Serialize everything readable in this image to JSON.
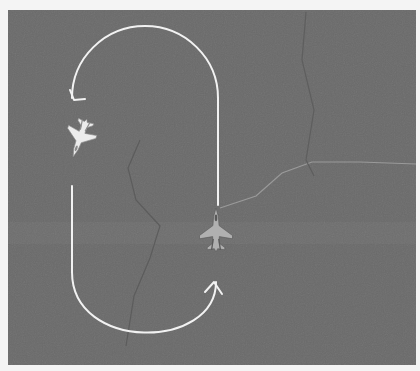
{
  "scene": {
    "kind": "racetrack-intercept-diagram",
    "background_color": "#6a6a6a",
    "band_color": "#727272",
    "page_color": "#f4f4f4",
    "frame": {
      "x": 8,
      "y": 10,
      "w": 408,
      "h": 355
    }
  },
  "flight_path": {
    "color": "#f2f2f2",
    "width": 2,
    "top_arc": {
      "from": [
        72,
        98
      ],
      "apex": [
        144,
        26
      ],
      "to": [
        218,
        98
      ],
      "direction": "counter-clockwise"
    },
    "right_leg": {
      "x": 218,
      "y_top": 98,
      "y_bottom": 205
    },
    "left_leg": {
      "x": 72,
      "y_top": 186,
      "y_bottom": 272
    },
    "bottom_arc": {
      "from": [
        72,
        272
      ],
      "apex": [
        144,
        346
      ],
      "to": [
        216,
        282
      ]
    },
    "arrows": [
      {
        "name": "arrow-top-left",
        "tip": [
          74,
          100
        ],
        "direction": "down-left"
      },
      {
        "name": "arrow-bottom-right",
        "tip": [
          214,
          282
        ],
        "direction": "up"
      }
    ]
  },
  "terrain_lines": [
    {
      "name": "border-east",
      "color": "#9a9a9a",
      "points": [
        [
          220,
          208
        ],
        [
          256,
          196
        ],
        [
          282,
          173
        ],
        [
          312,
          162
        ],
        [
          360,
          162
        ],
        [
          416,
          164
        ]
      ]
    },
    {
      "name": "ridge-center",
      "color": "#5c5c5c",
      "points": [
        [
          140,
          140
        ],
        [
          128,
          168
        ],
        [
          136,
          200
        ],
        [
          160,
          226
        ],
        [
          150,
          258
        ],
        [
          134,
          296
        ],
        [
          126,
          346
        ]
      ]
    },
    {
      "name": "ridge-north",
      "color": "#5e5e5e",
      "points": [
        [
          306,
          12
        ],
        [
          302,
          60
        ],
        [
          314,
          110
        ],
        [
          306,
          160
        ],
        [
          314,
          176
        ]
      ]
    }
  ],
  "aircraft": [
    {
      "name": "bandit-jet",
      "role": "opposing",
      "color": "#ececec",
      "x": 80,
      "y": 138,
      "heading_deg": 200,
      "scale": 1.0
    },
    {
      "name": "friendly-jet",
      "role": "own-ship",
      "color": "#b0b0b0",
      "x": 216,
      "y": 230,
      "heading_deg": 0,
      "scale": 1.1
    }
  ]
}
